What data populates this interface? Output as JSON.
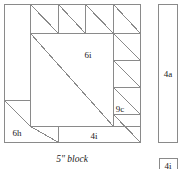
{
  "figure": {
    "kind": "quilt-block-piecing-diagram",
    "caption": "5\" block",
    "stroke_color": "#8a8a8a",
    "label_color": "#1a1a1a",
    "background": "#ffffff"
  },
  "main_block": {
    "name": "5 inch block",
    "x": 4,
    "y": 4,
    "width": 137,
    "height": 139,
    "patch_labels": [
      {
        "id": "6i",
        "text": "6i",
        "x": 88,
        "y": 58
      },
      {
        "id": "9c",
        "text": "9c",
        "x": 118,
        "y": 112
      },
      {
        "id": "6h",
        "text": "6h",
        "x": 16,
        "y": 133
      },
      {
        "id": "4i",
        "text": "4i",
        "x": 91,
        "y": 138
      }
    ]
  },
  "side_strip": {
    "name": "border strip",
    "label": "4a",
    "x": 158,
    "y": 4,
    "width": 20,
    "height": 139,
    "label_x": 168,
    "label_y": 76
  },
  "corner_square": {
    "name": "corner square",
    "label": "4i",
    "x": 159,
    "y": 158,
    "width": 19,
    "height": 16
  },
  "geometry": {
    "outer": {
      "left": 4,
      "top": 4,
      "right": 141,
      "bottom": 143
    },
    "v_lines": [
      30,
      58,
      85,
      113
    ],
    "h_lines": [
      33,
      60,
      87,
      114,
      126
    ],
    "notes": "half-square-triangle units along top row and right column; large triangle in centre; corner triangle bottom-left"
  }
}
